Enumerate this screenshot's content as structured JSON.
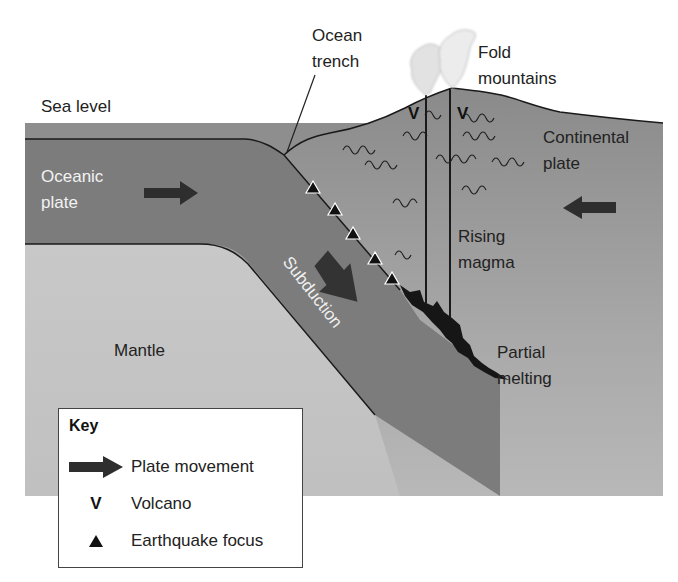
{
  "diagram": {
    "colors": {
      "sea": "#8c8c8c",
      "oceanic_plate": "#7a7a7a",
      "continental_plate": "#858585",
      "mantle": "#c4c4c4",
      "magma": "#1a1a1a",
      "arrow": "#2e2e2e",
      "ash_cloud": "#e6e6e6"
    },
    "labels": {
      "sea_level": "Sea level",
      "ocean_trench_line1": "Ocean",
      "ocean_trench_line2": "trench",
      "fold_mountains_line1": "Fold",
      "fold_mountains_line2": "mountains",
      "oceanic_plate_line1": "Oceanic",
      "oceanic_plate_line2": "plate",
      "continental_plate_line1": "Continental",
      "continental_plate_line2": "plate",
      "rising_magma_line1": "Rising",
      "rising_magma_line2": "magma",
      "subduction": "Subduction",
      "mantle": "Mantle",
      "partial_melting_line1": "Partial",
      "partial_melting_line2": "melting"
    },
    "volcano_marks": [
      "V",
      "V"
    ],
    "earthquake_foci_count": 5
  },
  "key": {
    "title": "Key",
    "items": [
      {
        "symbol": "arrow",
        "label": "Plate movement"
      },
      {
        "symbol": "V",
        "label": "Volcano"
      },
      {
        "symbol": "triangle",
        "label": "Earthquake focus"
      }
    ]
  }
}
